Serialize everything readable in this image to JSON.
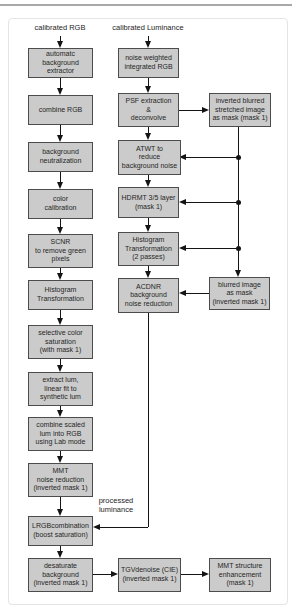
{
  "figure": {
    "inputs": {
      "left": "calibrated RGB",
      "right": "calibrated Luminance"
    },
    "edge_label": "processed\nluminance",
    "nodes": [
      {
        "id": "abe",
        "label": "automatc\nbackground\nextractor"
      },
      {
        "id": "combine_rgb",
        "label": "combine RGB"
      },
      {
        "id": "bg_neutralization",
        "label": "background\nneutralization"
      },
      {
        "id": "color_calibration",
        "label": "color\ncalibration"
      },
      {
        "id": "scnr",
        "label": "SCNR\nto remove green\npixels"
      },
      {
        "id": "histogram_transformation",
        "label": "Histogram\nTransformation"
      },
      {
        "id": "selective_color",
        "label": "selective color\nsaturation\n(with mask 1)"
      },
      {
        "id": "extract_lum",
        "label": "extract lum,\nlinear fit to\nsynthetic lum"
      },
      {
        "id": "combine_scaled",
        "label": "combine scaled\nlum into RGB\nusing Lab mode"
      },
      {
        "id": "mmt_noise",
        "label": "MMT\nnoise reduction\n(inverted mask 1)"
      },
      {
        "id": "lrgb",
        "label": "LRGBcombination\n(boost saturation)"
      },
      {
        "id": "desaturate",
        "label": "desaturate\nbackground\n(inverted mask 1)"
      },
      {
        "id": "nwir",
        "label": "noise weighted\nintegrated RGB"
      },
      {
        "id": "psf",
        "label": "PSF extraction\n&\ndeconvolve"
      },
      {
        "id": "atwt",
        "label": "ATWT to\nreduce\nbackground noise"
      },
      {
        "id": "hdrmt",
        "label": "HDRMT 3/5 layer\n(mask 1)"
      },
      {
        "id": "ht2",
        "label": "Histogram\nTransformation\n(2 passes)"
      },
      {
        "id": "acdnr",
        "label": "ACDNR\nbackground\nnoise reduction"
      },
      {
        "id": "tgv",
        "label": "TGVdenoise (CIE)\n(inverted mask 1)"
      },
      {
        "id": "ibsi",
        "label": "inverted blurred\nstretched image\nas mask (mask 1)"
      },
      {
        "id": "blurred",
        "label": "blurred image\nas mask\n(inverted mask 1)"
      },
      {
        "id": "mmt_structure",
        "label": "MMT structure\nenhancement\n(mask 1)"
      }
    ]
  },
  "colors": {
    "page_bg": "#ffffff",
    "frame": "#e4e4e4",
    "rule": "#a8a8a8",
    "node_fill": "#cbcbcb",
    "node_border": "#4c4c4c",
    "text": "#262626",
    "line": "#141414"
  }
}
